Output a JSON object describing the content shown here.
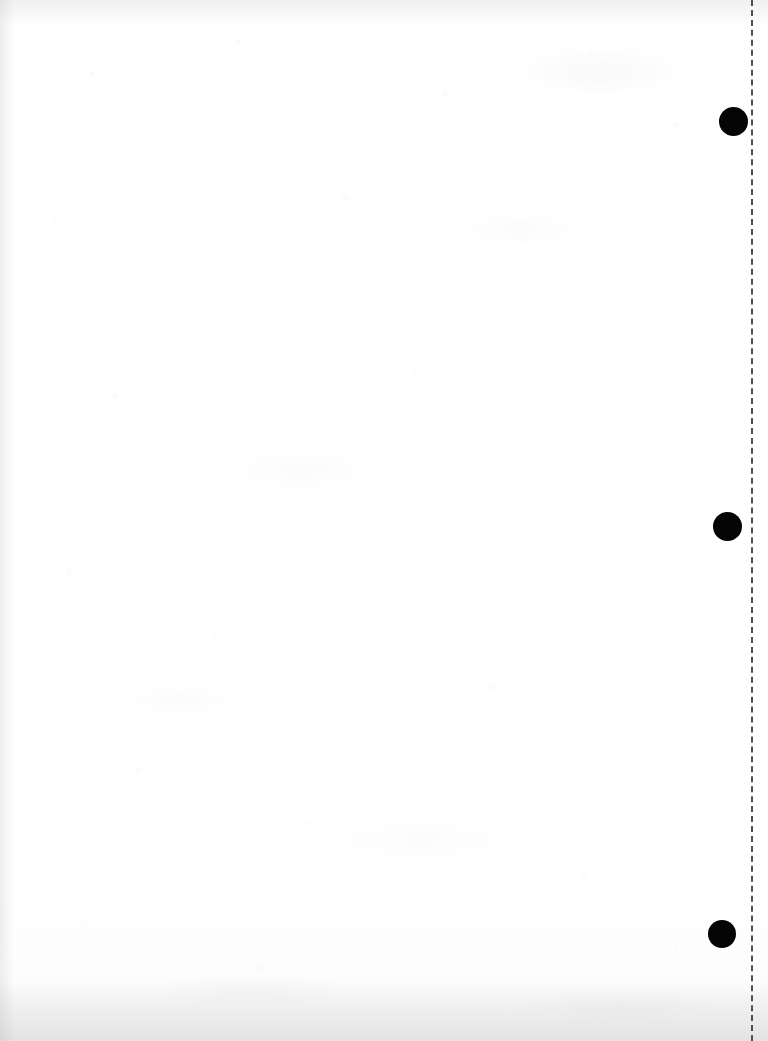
{
  "page": {
    "name": "scanned-blank-page",
    "width": 768,
    "height": 1041,
    "background_color": "#fdfdfd",
    "content_text": ""
  },
  "margin_rule": {
    "name": "dashed-margin-line",
    "orientation": "vertical",
    "x": 751,
    "y_start": 0,
    "y_end": 1041,
    "thickness": 2,
    "dash_length": 7,
    "gap_length": 6,
    "color": "#4f4f4f"
  },
  "punch_dots": [
    {
      "label": "registration-dot-1",
      "center_x": 733,
      "center_y": 121,
      "diameter": 29,
      "color": "#050505"
    },
    {
      "label": "registration-dot-2",
      "center_x": 727,
      "center_y": 526,
      "diameter": 29,
      "color": "#050505"
    },
    {
      "label": "registration-dot-3",
      "center_x": 722,
      "center_y": 934,
      "diameter": 28,
      "color": "#050505"
    }
  ],
  "scan_artifacts": {
    "left_edge_tint": "#96969b",
    "bottom_edge_tint": "#96969b",
    "noise_tint": "#787882"
  }
}
